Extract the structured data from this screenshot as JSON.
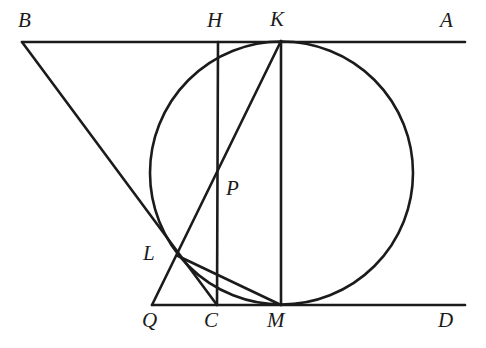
{
  "figure": {
    "kind": "euclidean-geometry-diagram",
    "title": "",
    "canvas": {
      "width": 486,
      "height": 348
    },
    "stroke_color": "#1b1b1b",
    "background_color": "#ffffff",
    "line_width": 2.6,
    "points": [
      {
        "id": "B",
        "label": "B",
        "x": 22,
        "y": 42,
        "label_x": 18,
        "label_y": 10
      },
      {
        "id": "H",
        "label": "H",
        "x": 218,
        "y": 42,
        "label_x": 207,
        "label_y": 10
      },
      {
        "id": "K",
        "label": "K",
        "x": 281,
        "y": 41,
        "label_x": 270,
        "label_y": 9
      },
      {
        "id": "A",
        "label": "A",
        "x": 465,
        "y": 42,
        "label_x": 440,
        "label_y": 10
      },
      {
        "id": "P",
        "label": "P",
        "x": 218,
        "y": 172,
        "label_x": 226,
        "label_y": 178
      },
      {
        "id": "L",
        "label": "L",
        "x": 178,
        "y": 256,
        "label_x": 143,
        "label_y": 243
      },
      {
        "id": "Q",
        "label": "Q",
        "x": 152,
        "y": 305,
        "label_x": 142,
        "label_y": 310
      },
      {
        "id": "C",
        "label": "C",
        "x": 217,
        "y": 305,
        "label_x": 204,
        "label_y": 310
      },
      {
        "id": "M",
        "label": "M",
        "x": 281,
        "y": 305,
        "label_x": 267,
        "label_y": 310
      },
      {
        "id": "D",
        "label": "D",
        "x": 465,
        "y": 305,
        "label_x": 438,
        "label_y": 310
      }
    ],
    "circle": {
      "name": "inscribed-circle",
      "cx": 281.5,
      "cy": 173,
      "r": 131.5,
      "tangent_top": "K",
      "tangent_bottom": "M"
    },
    "segments": [
      {
        "name": "line-BA-top",
        "from": "B",
        "to": "A",
        "x1": 22,
        "y1": 42,
        "x2": 465,
        "y2": 42
      },
      {
        "name": "line-QD-bottom",
        "from": "Q",
        "to": "D",
        "x1": 152,
        "y1": 305,
        "x2": 465,
        "y2": 305
      },
      {
        "name": "segment-BC",
        "from": "B",
        "to": "C",
        "x1": 22,
        "y1": 42,
        "x2": 217,
        "y2": 305
      },
      {
        "name": "segment-QK",
        "from": "Q",
        "to": "K",
        "x1": 152,
        "y1": 305,
        "x2": 281,
        "y2": 41
      },
      {
        "name": "segment-HC",
        "from": "H",
        "to": "C",
        "x1": 218,
        "y1": 42,
        "x2": 217,
        "y2": 305
      },
      {
        "name": "segment-KM-diameter",
        "from": "K",
        "to": "M",
        "x1": 281,
        "y1": 41,
        "x2": 281,
        "y2": 305
      },
      {
        "name": "segment-LM",
        "from": "L",
        "to": "M",
        "x1": 178,
        "y1": 256,
        "x2": 281,
        "y2": 305
      }
    ],
    "labels_note": "point labels italic serif capitals"
  }
}
